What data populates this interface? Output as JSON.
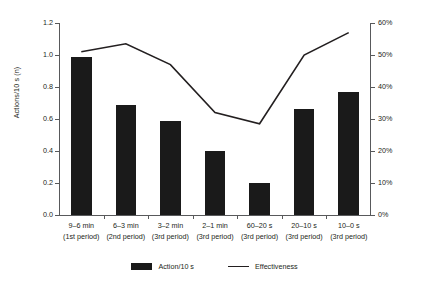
{
  "chart_data": {
    "type": "bar",
    "title": "",
    "subtitle": "",
    "xlabel": "",
    "ylabel": "Actions/10 s (n)",
    "y2label": "",
    "categories": [
      "9–6 min",
      "6–3 min",
      "3–2 min",
      "2–1 min",
      "60–20 s",
      "20–10 s",
      "10–0 s"
    ],
    "category_sublabels": [
      "(1st period)",
      "(2nd period)",
      "(3rd period)",
      "(3rd period)",
      "(3rd period)",
      "(3rd period)",
      "(3rd period)"
    ],
    "series": [
      {
        "name": "Action/10 s",
        "type": "bar",
        "axis": "left",
        "color": "#1a1a1a",
        "values": [
          0.99,
          0.69,
          0.59,
          0.4,
          0.2,
          0.66,
          0.77
        ]
      },
      {
        "name": "Effectiveness",
        "type": "line",
        "axis": "right",
        "color": "#231f20",
        "values": [
          51,
          53.5,
          47,
          32,
          28.5,
          50,
          57
        ]
      }
    ],
    "ylim": [
      0.0,
      1.2
    ],
    "y2lim": [
      0,
      60
    ],
    "yticks": [
      "0.0",
      "0.2",
      "0.4",
      "0.6",
      "0.8",
      "1.0",
      "1.2"
    ],
    "ytick_values": [
      0.0,
      0.2,
      0.4,
      0.6,
      0.8,
      1.0,
      1.2
    ],
    "y2ticks": [
      "0%",
      "10%",
      "20%",
      "30%",
      "40%",
      "50%",
      "60%"
    ],
    "y2tick_values": [
      0,
      10,
      20,
      30,
      40,
      50,
      60
    ],
    "grid": false,
    "legend_position": "bottom"
  },
  "legend": {
    "entries": [
      {
        "label": "Action/10 s",
        "marker": "bar-swatch"
      },
      {
        "label": "Effectiveness",
        "marker": "line-swatch"
      }
    ]
  }
}
